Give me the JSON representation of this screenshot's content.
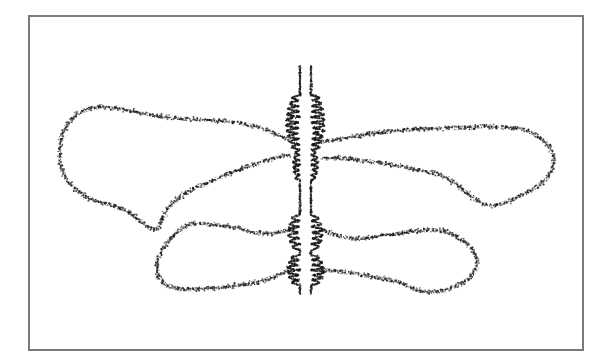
{
  "figure": {
    "frame": {
      "x": 28,
      "y": 15,
      "width": 554,
      "height": 334,
      "stroke": "#7a7a7a"
    },
    "ink_color": "#1a1a1a",
    "background": "#ffffff",
    "axis": {
      "strands": [
        {
          "x": 300,
          "y_top": 66,
          "y_bottom": 295
        },
        {
          "x": 311,
          "y_top": 66,
          "y_bottom": 295
        }
      ],
      "coil_regions": [
        {
          "y_start": 95,
          "y_end": 150,
          "amplitude": 14,
          "turns": 5
        },
        {
          "y_start": 150,
          "y_end": 180,
          "amplitude": 7,
          "turns": 3
        },
        {
          "y_start": 215,
          "y_end": 250,
          "amplitude": 12,
          "turns": 3
        },
        {
          "y_start": 255,
          "y_end": 285,
          "amplitude": 13,
          "turns": 3
        }
      ]
    },
    "loops": [
      {
        "name": "upper-left-loop",
        "points": [
          [
            290,
            140
          ],
          [
            255,
            125
          ],
          [
            215,
            120
          ],
          [
            170,
            118
          ],
          [
            135,
            112
          ],
          [
            105,
            106
          ],
          [
            80,
            110
          ],
          [
            62,
            130
          ],
          [
            58,
            160
          ],
          [
            68,
            185
          ],
          [
            95,
            202
          ],
          [
            125,
            208
          ],
          [
            148,
            228
          ],
          [
            158,
            230
          ],
          [
            168,
            205
          ],
          [
            190,
            190
          ],
          [
            225,
            175
          ],
          [
            265,
            160
          ],
          [
            290,
            155
          ]
        ]
      },
      {
        "name": "upper-right-loop",
        "points": [
          [
            322,
            142
          ],
          [
            360,
            135
          ],
          [
            400,
            130
          ],
          [
            450,
            128
          ],
          [
            500,
            126
          ],
          [
            530,
            130
          ],
          [
            552,
            148
          ],
          [
            555,
            168
          ],
          [
            538,
            188
          ],
          [
            510,
            200
          ],
          [
            490,
            208
          ],
          [
            470,
            196
          ],
          [
            445,
            175
          ],
          [
            410,
            168
          ],
          [
            375,
            162
          ],
          [
            345,
            158
          ],
          [
            322,
            158
          ]
        ]
      },
      {
        "name": "lower-left-loop",
        "points": [
          [
            293,
            228
          ],
          [
            265,
            236
          ],
          [
            240,
            228
          ],
          [
            215,
            225
          ],
          [
            190,
            222
          ],
          [
            170,
            238
          ],
          [
            155,
            262
          ],
          [
            160,
            283
          ],
          [
            180,
            290
          ],
          [
            210,
            288
          ],
          [
            240,
            286
          ],
          [
            268,
            280
          ],
          [
            290,
            270
          ]
        ]
      },
      {
        "name": "lower-right-loop",
        "points": [
          [
            322,
            230
          ],
          [
            350,
            240
          ],
          [
            380,
            236
          ],
          [
            410,
            232
          ],
          [
            440,
            228
          ],
          [
            468,
            242
          ],
          [
            480,
            262
          ],
          [
            468,
            282
          ],
          [
            440,
            292
          ],
          [
            420,
            292
          ],
          [
            400,
            282
          ],
          [
            370,
            276
          ],
          [
            345,
            272
          ],
          [
            322,
            270
          ]
        ]
      }
    ]
  }
}
